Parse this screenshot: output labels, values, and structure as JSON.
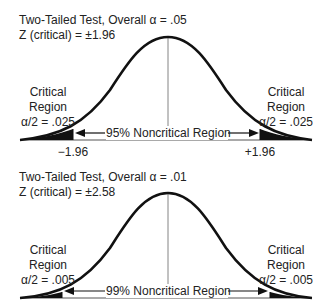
{
  "panels": [
    {
      "title": "Two-Tailed Test, Overall α = .05",
      "zcrit": "Z (critical) = ±1.96",
      "left_region": [
        "Critical",
        "Region",
        "α/2 = .025"
      ],
      "right_region": [
        "Critical",
        "Region",
        "α/2 = .025"
      ],
      "noncritical_label": "95% Noncritical Region",
      "left_tick": "−1.96",
      "right_tick": "+1.96"
    },
    {
      "title": "Two-Tailed Test, Overall α = .01",
      "zcrit": "Z (critical) = ±2.58",
      "left_region": [
        "Critical",
        "Region",
        "α/2 = .005"
      ],
      "right_region": [
        "Critical",
        "Region",
        "α/2 = .005"
      ],
      "noncritical_label": "99% Noncritical Region"
    }
  ],
  "colors": {
    "curve": "#111111",
    "tail_fill": "#111111",
    "line": "#555555"
  }
}
